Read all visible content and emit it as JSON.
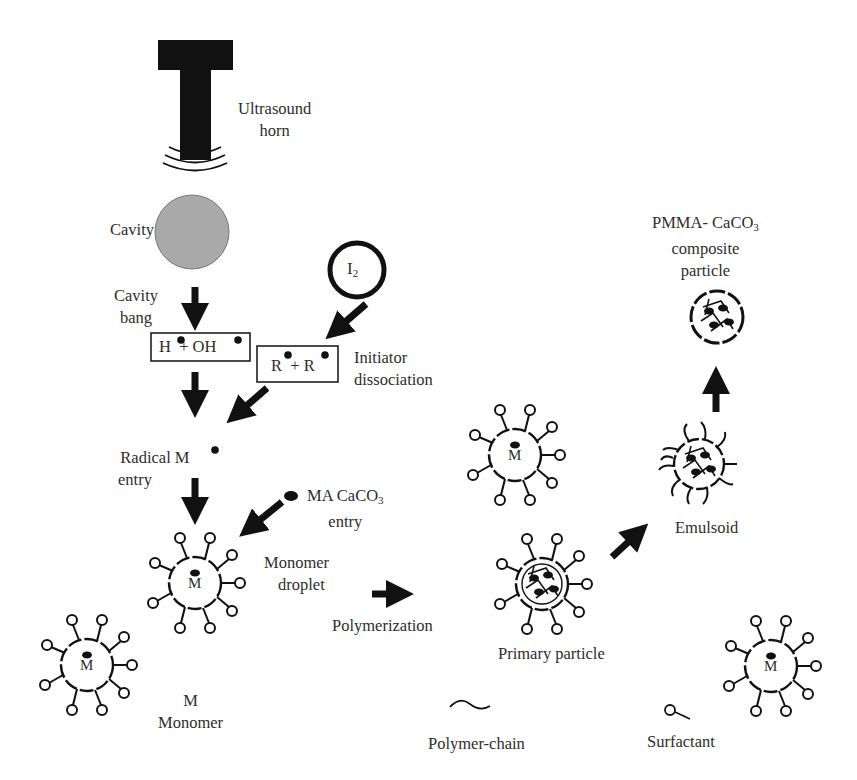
{
  "diagram": {
    "type": "process-schematic",
    "topic": "Ultrasonic-assisted emulsion polymerization of PMMA-CaCO3 composite particles",
    "labels": {
      "ultrasound_horn": [
        "Ultrasound",
        "horn"
      ],
      "cavity": "Cavity",
      "cavity_bang": [
        "Cavity",
        "bang"
      ],
      "radicals_box_1": {
        "left": "H",
        "plus": "+",
        "right": "OH"
      },
      "radicals_box_2": {
        "left": "R",
        "plus": "+",
        "right": "R"
      },
      "initiator": {
        "symbol": "I",
        "subscript": "2"
      },
      "initiator_dissociation": [
        "Initiator",
        "dissociation"
      ],
      "radical_entry": {
        "line1": "Radical M",
        "line2": "entry"
      },
      "ma_caco3_entry": {
        "line1_a": "MA CaCO",
        "line1_sub": "3",
        "line2": "entry"
      },
      "monomer_droplet": [
        "Monomer",
        "droplet"
      ],
      "polymerization": "Polymerization",
      "primary_particle": "Primary particle",
      "emulsoid": "Emulsoid",
      "composite_particle": {
        "line1_a": "PMMA- CaCO",
        "line1_sub": "3",
        "line2": "composite",
        "line3": "particle"
      },
      "droplet_core_letter": "M"
    },
    "legend": [
      {
        "symbol": "M",
        "label": "Monomer"
      },
      {
        "symbol": "wavy-line",
        "label": "Polymer-chain"
      },
      {
        "symbol": "head-tail",
        "label": "Surfactant"
      }
    ],
    "colors": {
      "ink": "#111111",
      "text": "#2d2d2d",
      "cavity_fill": "#a9a9a9",
      "background": "#ffffff"
    }
  }
}
